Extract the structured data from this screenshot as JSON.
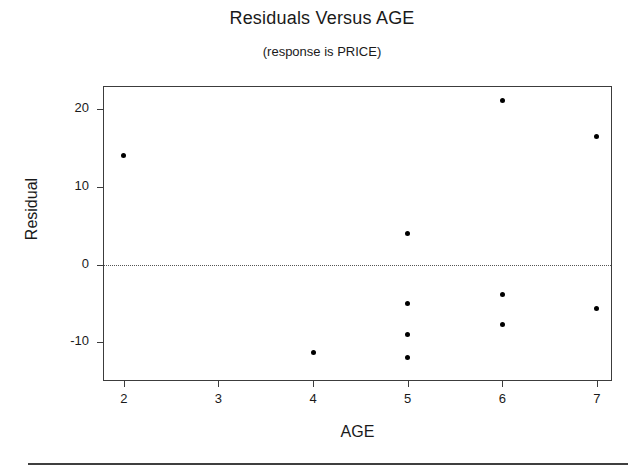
{
  "chart_data": {
    "type": "scatter",
    "title": "Residuals Versus AGE",
    "subtitle": "(response is PRICE)",
    "xlabel": "AGE",
    "ylabel": "Residual",
    "xlim": [
      1.78,
      7.16
    ],
    "ylim": [
      -15.0,
      23.0
    ],
    "xticks": [
      2,
      3,
      4,
      5,
      6,
      7
    ],
    "xtick_labels": [
      "2",
      "3",
      "4",
      "5",
      "6",
      "7"
    ],
    "yticks": [
      20,
      10,
      0,
      -10
    ],
    "ytick_labels": [
      "20",
      "10",
      "0",
      "-10"
    ],
    "grid": false,
    "legend": false,
    "reference_line": {
      "axis": "y",
      "value": 0,
      "style": "dotted"
    },
    "marker": {
      "shape": "circle",
      "color": "#000000",
      "size": 5
    },
    "points": [
      {
        "x": 2,
        "y": 14.0
      },
      {
        "x": 4,
        "y": -11.3
      },
      {
        "x": 5,
        "y": 4.0
      },
      {
        "x": 5,
        "y": -5.0
      },
      {
        "x": 5,
        "y": -9.0
      },
      {
        "x": 5,
        "y": -12.0
      },
      {
        "x": 6,
        "y": 21.1
      },
      {
        "x": 6,
        "y": -3.9
      },
      {
        "x": 6,
        "y": -7.7
      },
      {
        "x": 7,
        "y": 16.5
      },
      {
        "x": 7,
        "y": -5.6
      }
    ]
  }
}
